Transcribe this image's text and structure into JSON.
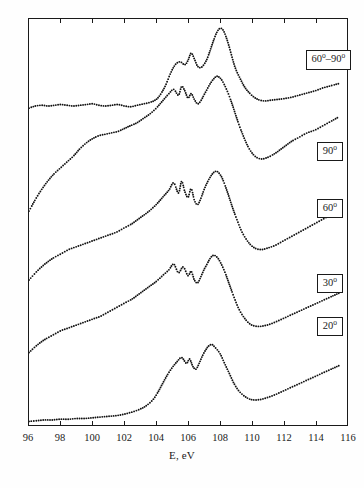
{
  "chart_data": {
    "type": "line",
    "title": "",
    "subtitle": "",
    "xlabel": "E, eV",
    "ylabel": "",
    "xlim": [
      96,
      116
    ],
    "ylim": [
      0,
      5.6
    ],
    "xticks": [
      96,
      98,
      100,
      102,
      104,
      106,
      108,
      110,
      112,
      114,
      116
    ],
    "xticklabels": [
      "96",
      "98",
      "100",
      "102",
      "104",
      "106",
      "108",
      "110",
      "112",
      "114",
      "116"
    ],
    "grid": false,
    "legend_position": "inline-right-boxes",
    "annotations": [
      {
        "label": "60º–90º",
        "x": 113.6,
        "y": 5.15
      },
      {
        "label": "90º",
        "x": 114.0,
        "y": 3.86
      },
      {
        "label": "60º",
        "x": 114.0,
        "y": 3.06
      },
      {
        "label": "30º",
        "x": 114.0,
        "y": 2.05
      },
      {
        "label": "20º",
        "x": 114.0,
        "y": 1.46
      }
    ],
    "series": [
      {
        "name": "60º–90º",
        "offset": 4.35,
        "x": [
          96.0,
          96.4,
          96.8,
          97.2,
          97.6,
          98.0,
          98.4,
          98.8,
          99.2,
          99.6,
          100.0,
          100.4,
          100.8,
          101.2,
          101.6,
          102.0,
          102.4,
          102.8,
          103.2,
          103.6,
          104.0,
          104.3,
          104.6,
          104.9,
          105.2,
          105.5,
          105.8,
          106.0,
          106.2,
          106.4,
          106.6,
          106.8,
          107.0,
          107.2,
          107.4,
          107.6,
          107.8,
          108.0,
          108.2,
          108.4,
          108.6,
          108.8,
          109.0,
          109.3,
          109.6,
          110.0,
          110.4,
          110.8,
          111.2,
          111.6,
          112.0,
          112.5,
          113.0,
          113.5,
          114.0,
          114.5,
          115.0,
          115.5
        ],
        "values": [
          0.02,
          0.05,
          0.06,
          0.05,
          0.06,
          0.07,
          0.06,
          0.05,
          0.06,
          0.07,
          0.08,
          0.06,
          0.05,
          0.06,
          0.07,
          0.05,
          0.04,
          0.06,
          0.08,
          0.1,
          0.14,
          0.22,
          0.34,
          0.5,
          0.62,
          0.66,
          0.62,
          0.68,
          0.78,
          0.7,
          0.6,
          0.58,
          0.62,
          0.7,
          0.82,
          0.95,
          1.06,
          1.12,
          1.1,
          1.0,
          0.86,
          0.7,
          0.56,
          0.42,
          0.3,
          0.2,
          0.14,
          0.12,
          0.13,
          0.14,
          0.15,
          0.17,
          0.2,
          0.23,
          0.26,
          0.3,
          0.33,
          0.36
        ]
      },
      {
        "name": "90º",
        "offset": 2.95,
        "x": [
          96.0,
          96.4,
          96.8,
          97.2,
          97.6,
          98.0,
          98.4,
          98.8,
          99.2,
          99.6,
          100.0,
          100.4,
          100.8,
          101.2,
          101.6,
          102.0,
          102.4,
          102.8,
          103.2,
          103.6,
          104.0,
          104.4,
          104.8,
          105.1,
          105.4,
          105.6,
          105.8,
          106.0,
          106.2,
          106.4,
          106.6,
          106.8,
          107.0,
          107.2,
          107.4,
          107.6,
          107.8,
          108.0,
          108.2,
          108.5,
          108.8,
          109.1,
          109.4,
          109.8,
          110.2,
          110.6,
          111.0,
          111.5,
          112.0,
          112.5,
          113.0,
          113.5,
          114.0,
          114.5,
          115.0,
          115.5
        ],
        "values": [
          0.0,
          0.16,
          0.3,
          0.42,
          0.52,
          0.6,
          0.68,
          0.76,
          0.86,
          0.94,
          1.0,
          1.04,
          1.06,
          1.08,
          1.1,
          1.14,
          1.18,
          1.22,
          1.28,
          1.34,
          1.42,
          1.52,
          1.62,
          1.68,
          1.6,
          1.72,
          1.66,
          1.56,
          1.62,
          1.54,
          1.48,
          1.52,
          1.6,
          1.68,
          1.76,
          1.82,
          1.86,
          1.84,
          1.78,
          1.64,
          1.46,
          1.26,
          1.08,
          0.88,
          0.76,
          0.72,
          0.74,
          0.8,
          0.88,
          0.96,
          1.02,
          1.08,
          1.12,
          1.18,
          1.24,
          1.3
        ]
      },
      {
        "name": "60º",
        "offset": 2.0,
        "x": [
          96.0,
          96.5,
          97.0,
          97.5,
          98.0,
          98.5,
          99.0,
          99.5,
          100.0,
          100.5,
          101.0,
          101.5,
          102.0,
          102.5,
          103.0,
          103.5,
          104.0,
          104.4,
          104.8,
          105.1,
          105.4,
          105.6,
          105.8,
          106.0,
          106.2,
          106.4,
          106.6,
          106.8,
          107.0,
          107.2,
          107.4,
          107.6,
          107.8,
          108.0,
          108.2,
          108.5,
          108.8,
          109.1,
          109.4,
          109.8,
          110.2,
          110.6,
          111.0,
          111.5,
          112.0,
          112.5,
          113.0,
          113.5,
          114.0,
          114.5,
          115.0,
          115.5
        ],
        "values": [
          0.0,
          0.12,
          0.22,
          0.3,
          0.36,
          0.42,
          0.46,
          0.5,
          0.54,
          0.58,
          0.62,
          0.66,
          0.72,
          0.78,
          0.86,
          0.94,
          1.04,
          1.14,
          1.24,
          1.34,
          1.2,
          1.36,
          1.22,
          1.14,
          1.26,
          1.1,
          1.04,
          1.12,
          1.24,
          1.34,
          1.42,
          1.48,
          1.5,
          1.46,
          1.38,
          1.2,
          1.0,
          0.82,
          0.66,
          0.52,
          0.44,
          0.42,
          0.44,
          0.48,
          0.54,
          0.6,
          0.66,
          0.72,
          0.78,
          0.84,
          0.9,
          0.96
        ]
      },
      {
        "name": "30º",
        "offset": 1.0,
        "x": [
          96.0,
          96.5,
          97.0,
          97.5,
          98.0,
          98.5,
          99.0,
          99.5,
          100.0,
          100.5,
          101.0,
          101.5,
          102.0,
          102.5,
          103.0,
          103.5,
          104.0,
          104.4,
          104.8,
          105.1,
          105.4,
          105.7,
          106.0,
          106.2,
          106.4,
          106.6,
          106.8,
          107.0,
          107.2,
          107.4,
          107.6,
          107.8,
          108.0,
          108.3,
          108.6,
          108.9,
          109.2,
          109.6,
          110.0,
          110.5,
          111.0,
          111.5,
          112.0,
          112.5,
          113.0,
          113.5,
          114.0,
          114.5,
          115.0,
          115.5
        ],
        "values": [
          0.0,
          0.1,
          0.18,
          0.24,
          0.3,
          0.34,
          0.38,
          0.42,
          0.46,
          0.5,
          0.56,
          0.62,
          0.68,
          0.74,
          0.82,
          0.9,
          0.98,
          1.06,
          1.14,
          1.22,
          1.1,
          1.18,
          1.06,
          1.12,
          1.0,
          0.96,
          1.04,
          1.14,
          1.22,
          1.3,
          1.34,
          1.32,
          1.26,
          1.12,
          0.94,
          0.76,
          0.6,
          0.46,
          0.38,
          0.36,
          0.38,
          0.42,
          0.47,
          0.52,
          0.57,
          0.62,
          0.67,
          0.72,
          0.77,
          0.82
        ]
      },
      {
        "name": "20º",
        "offset": 0.05,
        "x": [
          96.0,
          96.5,
          97.0,
          97.5,
          98.0,
          98.5,
          99.0,
          99.5,
          100.0,
          100.5,
          101.0,
          101.5,
          102.0,
          102.5,
          103.0,
          103.4,
          103.8,
          104.1,
          104.4,
          104.7,
          105.0,
          105.3,
          105.6,
          105.9,
          106.1,
          106.3,
          106.5,
          106.7,
          106.9,
          107.1,
          107.3,
          107.5,
          107.7,
          108.0,
          108.3,
          108.6,
          108.9,
          109.2,
          109.6,
          110.0,
          110.5,
          111.0,
          111.5,
          112.0,
          112.5,
          113.0,
          113.5,
          114.0,
          114.5,
          115.0,
          115.5
        ],
        "values": [
          0.0,
          0.01,
          0.02,
          0.02,
          0.03,
          0.03,
          0.04,
          0.04,
          0.05,
          0.06,
          0.07,
          0.08,
          0.1,
          0.13,
          0.17,
          0.22,
          0.3,
          0.4,
          0.52,
          0.64,
          0.74,
          0.82,
          0.88,
          0.8,
          0.86,
          0.76,
          0.72,
          0.8,
          0.9,
          0.98,
          1.04,
          1.06,
          1.02,
          0.94,
          0.8,
          0.66,
          0.52,
          0.42,
          0.34,
          0.3,
          0.3,
          0.33,
          0.37,
          0.42,
          0.47,
          0.52,
          0.57,
          0.62,
          0.67,
          0.72,
          0.77
        ]
      }
    ]
  },
  "axis": {
    "x_title": "E, eV",
    "tick_labels": [
      "96",
      "98",
      "100",
      "102",
      "104",
      "106",
      "108",
      "110",
      "112",
      "114",
      "116"
    ]
  },
  "labels": {
    "box_60_90": "60º–90º",
    "box_90": "90º",
    "box_60": "60º",
    "box_30": "30º",
    "box_20": "20º"
  }
}
